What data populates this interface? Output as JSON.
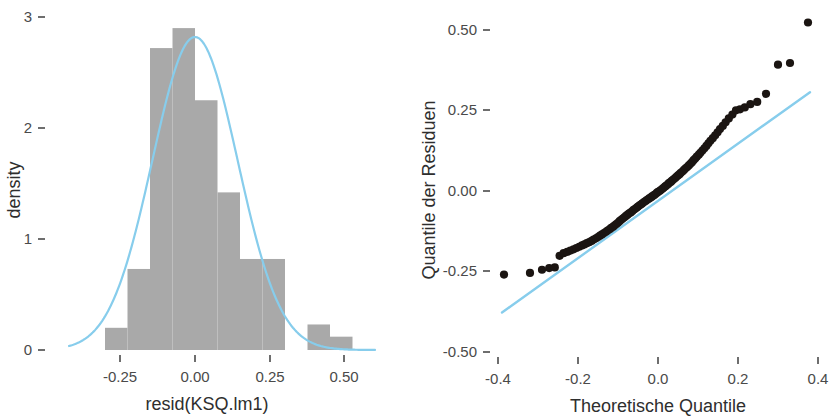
{
  "figure": {
    "background": "#ffffff",
    "bar_color": "#a9a9a9",
    "curve_color": "#87cdec",
    "point_color": "#1b1512",
    "panels": [
      "histogram-density",
      "qq-plot"
    ]
  },
  "histogram": {
    "x_axis_title": "resid(KSQ.lm1)",
    "y_axis_title": "density",
    "x_ticks": [
      "-0.25",
      "0.00",
      "0.25",
      "0.50"
    ],
    "y_ticks": [
      "0",
      "1",
      "2",
      "3"
    ]
  },
  "qq": {
    "x_axis_title": "Theoretische Quantile",
    "y_axis_title": "Quantile der Residuen",
    "x_ticks": [
      "-0.4",
      "-0.2",
      "0.0",
      "0.2",
      "0.4"
    ],
    "y_ticks": [
      "-0.50",
      "-0.25",
      "0.00",
      "0.25",
      "0.50"
    ]
  },
  "chart_data": [
    {
      "type": "bar",
      "title": "Histogram of residuals with density overlay",
      "xlabel": "resid(KSQ.lm1)",
      "ylabel": "density",
      "xlim": [
        -0.42,
        0.6
      ],
      "ylim": [
        0,
        3.05
      ],
      "grid": false,
      "legend": "none",
      "bin_width": 0.075,
      "bin_edges": [
        -0.3,
        -0.225,
        -0.15,
        -0.075,
        0.0,
        0.075,
        0.15,
        0.225,
        0.3,
        0.375,
        0.45,
        0.525
      ],
      "categories": [
        "-0.30..-0.225",
        "-0.225..-0.15",
        "-0.15..-0.075",
        "-0.075..0.00",
        "0.00..0.075",
        "0.075..0.15",
        "0.15..0.225",
        "0.225..0.30",
        "0.30..0.375",
        "0.375..0.45",
        "0.45..0.525"
      ],
      "values": [
        0.2,
        0.73,
        2.72,
        2.9,
        2.25,
        1.42,
        0.82,
        0.82,
        0.0,
        0.23,
        0.12
      ],
      "overlay": {
        "type": "line",
        "name": "normal density",
        "color": "#87cdec",
        "mean": 0.0,
        "sd": 0.142,
        "peak": 2.82
      }
    },
    {
      "type": "scatter",
      "title": "Normal Q-Q plot of residuals",
      "xlabel": "Theoretische Quantile",
      "ylabel": "Quantile der Residuen",
      "xlim": [
        -0.45,
        0.42
      ],
      "ylim": [
        -0.56,
        0.56
      ],
      "grid": false,
      "legend": "none",
      "point_color": "#1b1512",
      "reference_line": {
        "type": "line",
        "color": "#87cdec",
        "x": [
          -0.39,
          0.38
        ],
        "y": [
          -0.375,
          0.305
        ]
      },
      "x": [
        -0.385,
        -0.32,
        -0.29,
        -0.272,
        -0.258,
        -0.246,
        -0.236,
        -0.227,
        -0.219,
        -0.211,
        -0.204,
        -0.197,
        -0.19,
        -0.184,
        -0.178,
        -0.172,
        -0.166,
        -0.161,
        -0.155,
        -0.15,
        -0.145,
        -0.14,
        -0.135,
        -0.13,
        -0.126,
        -0.121,
        -0.117,
        -0.112,
        -0.108,
        -0.104,
        -0.1,
        -0.096,
        -0.092,
        -0.088,
        -0.084,
        -0.08,
        -0.076,
        -0.072,
        -0.068,
        -0.064,
        -0.061,
        -0.057,
        -0.053,
        -0.05,
        -0.046,
        -0.042,
        -0.039,
        -0.035,
        -0.031,
        -0.028,
        -0.024,
        -0.021,
        -0.017,
        -0.014,
        -0.01,
        -0.007,
        -0.003,
        0.0,
        0.004,
        0.007,
        0.011,
        0.014,
        0.018,
        0.021,
        0.025,
        0.028,
        0.032,
        0.035,
        0.039,
        0.043,
        0.046,
        0.05,
        0.054,
        0.057,
        0.061,
        0.065,
        0.069,
        0.073,
        0.077,
        0.081,
        0.085,
        0.089,
        0.093,
        0.097,
        0.102,
        0.106,
        0.111,
        0.116,
        0.121,
        0.126,
        0.131,
        0.137,
        0.143,
        0.149,
        0.155,
        0.162,
        0.169,
        0.177,
        0.186,
        0.195,
        0.205,
        0.217,
        0.231,
        0.248,
        0.27,
        0.3,
        0.33,
        0.375
      ],
      "y": [
        -0.258,
        -0.253,
        -0.243,
        -0.238,
        -0.236,
        -0.2,
        -0.192,
        -0.188,
        -0.184,
        -0.18,
        -0.176,
        -0.172,
        -0.168,
        -0.165,
        -0.161,
        -0.158,
        -0.154,
        -0.15,
        -0.146,
        -0.142,
        -0.138,
        -0.134,
        -0.13,
        -0.126,
        -0.122,
        -0.118,
        -0.114,
        -0.11,
        -0.106,
        -0.102,
        -0.098,
        -0.093,
        -0.089,
        -0.085,
        -0.081,
        -0.077,
        -0.073,
        -0.069,
        -0.066,
        -0.062,
        -0.058,
        -0.055,
        -0.051,
        -0.048,
        -0.044,
        -0.041,
        -0.038,
        -0.034,
        -0.031,
        -0.028,
        -0.025,
        -0.022,
        -0.019,
        -0.016,
        -0.013,
        -0.01,
        -0.006,
        -0.003,
        0.0,
        0.003,
        0.007,
        0.01,
        0.014,
        0.017,
        0.021,
        0.025,
        0.028,
        0.032,
        0.036,
        0.04,
        0.044,
        0.048,
        0.052,
        0.056,
        0.06,
        0.065,
        0.07,
        0.074,
        0.079,
        0.084,
        0.089,
        0.095,
        0.1,
        0.106,
        0.112,
        0.118,
        0.125,
        0.132,
        0.139,
        0.147,
        0.155,
        0.163,
        0.172,
        0.181,
        0.191,
        0.201,
        0.212,
        0.224,
        0.236,
        0.249,
        0.252,
        0.258,
        0.268,
        0.275,
        0.3,
        0.39,
        0.395,
        0.52
      ]
    }
  ]
}
